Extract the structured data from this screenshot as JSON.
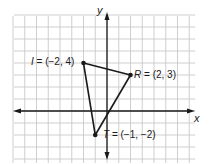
{
  "diagram": {
    "type": "coordinate-plane",
    "grid": {
      "origin_px": [
        107,
        111
      ],
      "unit_px_x": 11.75,
      "unit_px_y": 12,
      "x_range": [
        -8,
        7
      ],
      "y_range": [
        -4,
        8
      ],
      "grid_color": "#c9c9c9",
      "axis_color": "#1a1a1a"
    },
    "axes": {
      "x_label": "x",
      "y_label": "y"
    },
    "points": [
      {
        "name": "I",
        "x": -2,
        "y": 4,
        "label": "= (−2, 4)"
      },
      {
        "name": "R",
        "x": 2,
        "y": 3,
        "label": "= (2, 3)"
      },
      {
        "name": "T",
        "x": -1,
        "y": -2,
        "label": "= (−1, −2)"
      }
    ],
    "triangle": [
      "I",
      "R",
      "T"
    ],
    "line_color": "#1a1a1a"
  }
}
